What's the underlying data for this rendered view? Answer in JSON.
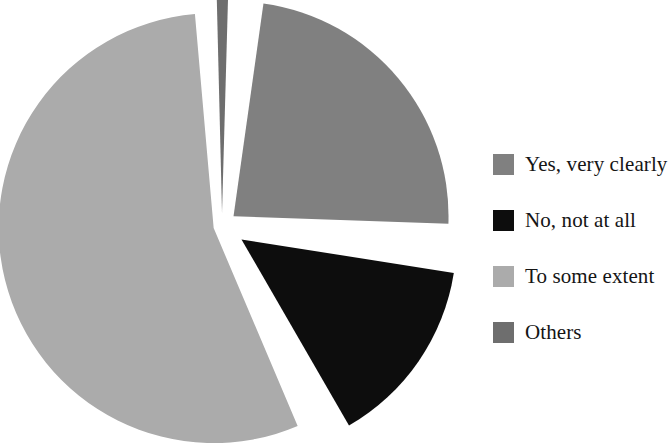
{
  "chart_data": {
    "type": "pie",
    "title": "",
    "subtitle": "",
    "xlabel": "",
    "ylabel": "",
    "grid": false,
    "legend_position": "right",
    "exploded": true,
    "categories": [
      "Yes, very clearly",
      "No, not at all",
      "To some extent",
      "Others"
    ],
    "values": [
      23,
      14,
      62,
      1
    ],
    "units": "percent",
    "slices": [
      {
        "label": "Yes, very clearly",
        "value": 23,
        "color": "#808080",
        "start_angle_deg": 8,
        "end_angle_deg": 92,
        "explode": 0.07
      },
      {
        "label": "No, not at all",
        "value": 14,
        "color": "#0d0d0d",
        "start_angle_deg": 99,
        "end_angle_deg": 150,
        "explode": 0.11
      },
      {
        "label": "To some extent",
        "value": 62,
        "color": "#ababab",
        "start_angle_deg": 157,
        "end_angle_deg": 355,
        "explode": 0.04
      },
      {
        "label": "Others",
        "value": 1,
        "color": "#6e6e6e",
        "start_angle_deg": 358.6,
        "end_angle_deg": 361.6,
        "explode": 0.06
      }
    ],
    "geometry": {
      "center_x": 222,
      "center_y": 226,
      "radius": 215
    },
    "colors": {
      "yes_very_clearly": "#808080",
      "no_not_at_all": "#0d0d0d",
      "to_some_extent": "#ababab",
      "others": "#6e6e6e",
      "background": "#ffffff",
      "text": "#151515"
    }
  },
  "legend": {
    "items": [
      {
        "label": "Yes, very clearly",
        "color": "#808080"
      },
      {
        "label": "No, not at all",
        "color": "#0d0d0d"
      },
      {
        "label": "To some extent",
        "color": "#ababab"
      },
      {
        "label": "Others",
        "color": "#6e6e6e"
      }
    ]
  }
}
